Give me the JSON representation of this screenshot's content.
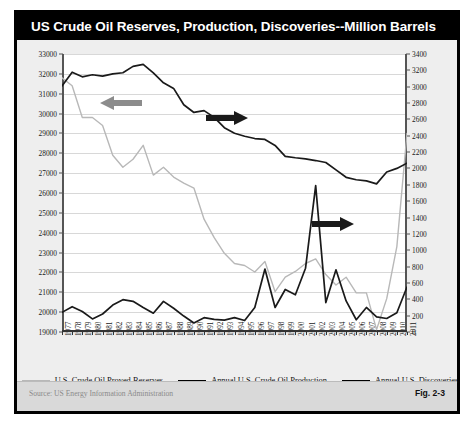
{
  "figure": {
    "title": "US Crude Oil Reserves, Production, Discoveries--Million Barrels",
    "source": "Source:  US Energy Information Administration",
    "fig_number": "Fig. 2-3"
  },
  "legend": [
    {
      "label": "U.S. Crude Oil Proved Reserves",
      "color": "#b8b8b8"
    },
    {
      "label": "Annual U.S. Crude Oil Production",
      "color": "#000000"
    },
    {
      "label": "Annual U.S. Discoveries",
      "color": "#000000"
    }
  ],
  "annotations": [
    {
      "name": "left-arrow-reserves",
      "direction": "left",
      "color": "#8c8c8c"
    },
    {
      "name": "right-arrow-production",
      "direction": "right",
      "color": "#1a1a1a"
    },
    {
      "name": "right-arrow-discoveries",
      "direction": "right",
      "color": "#1a1a1a"
    }
  ],
  "chart_data": {
    "type": "line",
    "title": "US Crude Oil Reserves, Production, Discoveries--Million Barrels",
    "xlabel": "",
    "ylabel": "",
    "grid": true,
    "legend_position": "bottom",
    "x": [
      1977,
      1978,
      1979,
      1980,
      1981,
      1982,
      1983,
      1984,
      1985,
      1986,
      1987,
      1988,
      1989,
      1990,
      1991,
      1992,
      1993,
      1994,
      1995,
      1996,
      1997,
      1998,
      1999,
      2000,
      2001,
      2002,
      2003,
      2004,
      2005,
      2006,
      2007,
      2008,
      2009,
      2010,
      2011
    ],
    "xtick_labels": [
      "1977",
      "1978",
      "1979",
      "1980",
      "1981",
      "1982",
      "1983",
      "1984",
      "1985",
      "1986",
      "1987",
      "1988",
      "1989",
      "1990",
      "1991",
      "1992",
      "1993",
      "1994",
      "1995",
      "1996",
      "1997",
      "1998",
      "1999",
      "2000",
      "2001",
      "2002",
      "2003",
      "2004",
      "2005",
      "2006",
      "2007",
      "2008",
      "2009",
      "2010",
      "2011"
    ],
    "left_axis": {
      "label": "",
      "ylim": [
        19000,
        33000
      ],
      "ticks": [
        19000,
        20000,
        21000,
        22000,
        23000,
        24000,
        25000,
        26000,
        27000,
        28000,
        29000,
        30000,
        31000,
        32000,
        33000
      ],
      "tick_labels": [
        "19000",
        "20000",
        "21000",
        "22000",
        "23000",
        "24000",
        "25000",
        "26000",
        "27000",
        "28000",
        "29000",
        "30000",
        "31000",
        "32000",
        "33000"
      ]
    },
    "right_axis": {
      "label": "",
      "ylim": [
        0,
        3400
      ],
      "ticks": [
        0,
        200,
        400,
        600,
        800,
        1000,
        1200,
        1400,
        1600,
        1800,
        2000,
        2200,
        2400,
        2600,
        2800,
        3000,
        3200,
        3400
      ],
      "tick_labels": [
        "0",
        "200",
        "400",
        "600",
        "800",
        "1000",
        "1200",
        "1400",
        "1600",
        "1800",
        "2000",
        "2200",
        "2400",
        "2600",
        "2800",
        "3000",
        "3200",
        "3400"
      ]
    },
    "series": [
      {
        "name": "U.S. Crude Oil Proved Reserves",
        "axis": "left",
        "color": "#b8b8b8",
        "units": "million barrels",
        "values": [
          31800,
          31400,
          29800,
          29800,
          29400,
          27900,
          27300,
          27700,
          28400,
          26900,
          27300,
          26800,
          26500,
          26250,
          24680,
          23750,
          22960,
          22450,
          22350,
          22020,
          22550,
          21030,
          21760,
          22050,
          22450,
          22680,
          21890,
          21370,
          21760,
          20970,
          20970,
          19120,
          20680,
          23300,
          29000
        ]
      },
      {
        "name": "Annual U.S. Crude Oil Production",
        "axis": "right",
        "color": "#1a1a1a",
        "units": "million barrels",
        "values": [
          3009,
          3178,
          3121,
          3146,
          3129,
          3157,
          3171,
          3249,
          3274,
          3168,
          3047,
          2979,
          2779,
          2685,
          2707,
          2625,
          2499,
          2431,
          2394,
          2366,
          2355,
          2282,
          2147,
          2131,
          2118,
          2097,
          2073,
          1983,
          1892,
          1862,
          1848,
          1812,
          1957,
          2001,
          2065
        ]
      },
      {
        "name": "Annual U.S. Discoveries",
        "axis": "right",
        "color": "#1a1a1a",
        "units": "million barrels",
        "values": [
          240,
          310,
          250,
          160,
          220,
          330,
          395,
          375,
          300,
          230,
          375,
          290,
          195,
          110,
          175,
          155,
          145,
          175,
          140,
          300,
          770,
          300,
          520,
          455,
          780,
          1790,
          360,
          760,
          380,
          150,
          300,
          185,
          165,
          235,
          550
        ]
      }
    ]
  }
}
